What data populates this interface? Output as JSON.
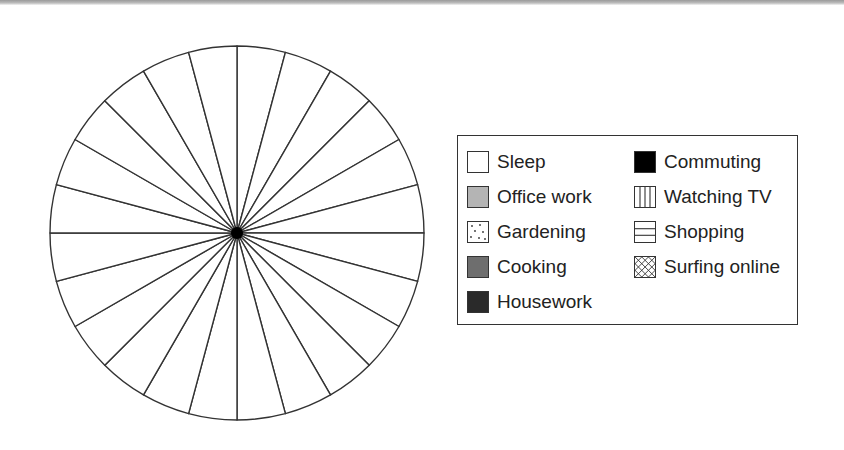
{
  "chart_data": {
    "type": "pie",
    "title": "",
    "segments": 24,
    "segment_unit": "hour",
    "values": [
      1,
      1,
      1,
      1,
      1,
      1,
      1,
      1,
      1,
      1,
      1,
      1,
      1,
      1,
      1,
      1,
      1,
      1,
      1,
      1,
      1,
      1,
      1,
      1
    ],
    "start_angle_deg": 0,
    "fill": "#ffffff",
    "stroke": "#333333",
    "legend_position": "right",
    "legend": [
      {
        "label": "Sleep",
        "pattern": "white",
        "color": "#ffffff"
      },
      {
        "label": "Office work",
        "pattern": "light-gray",
        "color": "#b4b4b4"
      },
      {
        "label": "Gardening",
        "pattern": "dots",
        "color": "#ffffff"
      },
      {
        "label": "Cooking",
        "pattern": "medium-gray",
        "color": "#6e6e6e"
      },
      {
        "label": "Housework",
        "pattern": "dark-gray",
        "color": "#2a2a2a"
      },
      {
        "label": "Commuting",
        "pattern": "black",
        "color": "#000000"
      },
      {
        "label": "Watching TV",
        "pattern": "vertical-lines",
        "color": "#ffffff"
      },
      {
        "label": "Shopping",
        "pattern": "horizontal-lines",
        "color": "#ffffff"
      },
      {
        "label": "Surfing online",
        "pattern": "cross-hatch",
        "color": "#ffffff"
      }
    ]
  },
  "pie": {
    "cx": 237,
    "cy": 233,
    "r": 187,
    "stroke": "#333333",
    "center_dot_color": "#000000"
  },
  "legend": {
    "items": [
      {
        "label": "Sleep",
        "pattern": "white"
      },
      {
        "label": "Office work",
        "pattern": "light-gray"
      },
      {
        "label": "Gardening",
        "pattern": "dots"
      },
      {
        "label": "Cooking",
        "pattern": "medium-gray"
      },
      {
        "label": "Housework",
        "pattern": "dark-gray"
      },
      {
        "label": "Commuting",
        "pattern": "black"
      },
      {
        "label": "Watching TV",
        "pattern": "vertical-lines"
      },
      {
        "label": "Shopping",
        "pattern": "horizontal-lines"
      },
      {
        "label": "Surfing online",
        "pattern": "cross-hatch"
      }
    ]
  }
}
